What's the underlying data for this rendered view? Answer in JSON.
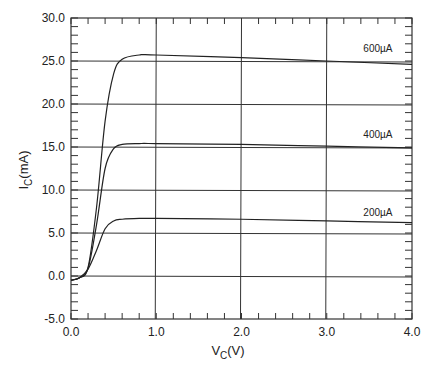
{
  "chart_data": {
    "type": "line",
    "title": "",
    "xlabel": "V_C(V)",
    "ylabel": "I_C(mA)",
    "xlim": [
      0.0,
      4.0
    ],
    "ylim": [
      -5.0,
      30.0
    ],
    "grid": true,
    "x_ticks": [
      "0.0",
      "1.0",
      "2.0",
      "3.0",
      "4.0"
    ],
    "y_ticks": [
      "-5.0",
      "0.0",
      "5.0",
      "10.0",
      "15.0",
      "20.0",
      "25.0",
      "30.0"
    ],
    "series": [
      {
        "name": "600µA",
        "x": [
          0.0,
          0.1,
          0.2,
          0.3,
          0.4,
          0.5,
          0.6,
          0.8,
          1.0,
          2.0,
          3.0,
          4.0
        ],
        "y": [
          -0.5,
          -0.2,
          1.0,
          8.0,
          18.0,
          23.5,
          25.2,
          25.7,
          25.7,
          25.4,
          25.0,
          24.6
        ]
      },
      {
        "name": "400µA",
        "x": [
          0.0,
          0.1,
          0.2,
          0.3,
          0.4,
          0.5,
          0.6,
          0.8,
          1.0,
          2.0,
          3.0,
          4.0
        ],
        "y": [
          -0.5,
          -0.2,
          0.9,
          6.0,
          12.5,
          14.8,
          15.3,
          15.4,
          15.4,
          15.3,
          15.1,
          14.9
        ]
      },
      {
        "name": "200µA",
        "x": [
          0.0,
          0.1,
          0.2,
          0.3,
          0.4,
          0.5,
          0.6,
          0.8,
          1.0,
          2.0,
          3.0,
          4.0
        ],
        "y": [
          -0.5,
          -0.2,
          0.8,
          3.0,
          5.5,
          6.4,
          6.6,
          6.7,
          6.7,
          6.6,
          6.4,
          6.2
        ]
      }
    ],
    "annotations": [
      {
        "text": "600µA",
        "x": 3.6,
        "y": 26.0
      },
      {
        "text": "400µA",
        "x": 3.6,
        "y": 16.0
      },
      {
        "text": "200µA",
        "x": 3.6,
        "y": 7.0
      }
    ]
  },
  "labels": {
    "ylabel_main": "I",
    "ylabel_sub": "C",
    "ylabel_unit": "(mA)",
    "xlabel_main": "V",
    "xlabel_sub": "C",
    "xlabel_unit": "(V)"
  }
}
